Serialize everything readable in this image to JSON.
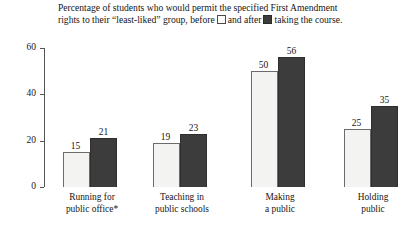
{
  "caption": {
    "line1": "Percentage of students who would permit the specified First Amendment",
    "line2_pre": "rights to their “least-liked” group, before",
    "line2_mid": "and after",
    "line2_post": "taking the course.",
    "legend_before_name": "before-swatch",
    "legend_after_name": "after-swatch"
  },
  "colors": {
    "before_fill": "#f3f3f1",
    "before_stroke": "#6b6b6b",
    "after_fill": "#3c3c3c",
    "after_stroke": "#2e2e2e",
    "axis": "#555555",
    "text": "#161616",
    "background": "#ffffff"
  },
  "chart_data": {
    "type": "bar",
    "xlabel": "",
    "ylabel": "",
    "ylim": [
      0,
      60
    ],
    "yticks": [
      0,
      20,
      40,
      60
    ],
    "ytick_labels": [
      "0",
      "20",
      "40",
      "60"
    ],
    "grid": false,
    "legend_position": "top-inline-caption",
    "categories": [
      "Running for public office*",
      "Teaching in public schools",
      "Making a public",
      "Holding public"
    ],
    "category_lines": [
      [
        "Running for",
        "public office*"
      ],
      [
        "Teaching in",
        "public schools"
      ],
      [
        "Making",
        "a public"
      ],
      [
        "Holding",
        "public"
      ]
    ],
    "series": [
      {
        "name": "before",
        "values": [
          15,
          19,
          50,
          25
        ]
      },
      {
        "name": "after",
        "values": [
          21,
          23,
          56,
          35
        ]
      }
    ]
  }
}
